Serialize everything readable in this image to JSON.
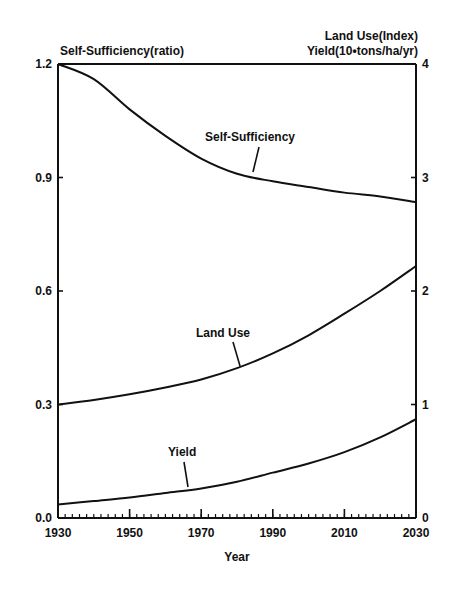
{
  "chart_data": {
    "type": "line",
    "title": "",
    "xlabel": "Year",
    "ylabel_left": "Self-Sufficiency(ratio)",
    "ylabel_right_line1": "Land Use(Index)",
    "ylabel_right_line2": "Yield(10•tons/ha/yr)",
    "xlim": [
      1930,
      2030
    ],
    "ylim_left": [
      0.0,
      1.2
    ],
    "ylim_right": [
      0,
      4
    ],
    "x_ticks": [
      "1930",
      "1950",
      "1970",
      "1990",
      "2010",
      "2030"
    ],
    "y_ticks_left": [
      "0.0",
      "0.3",
      "0.6",
      "0.9",
      "1.2"
    ],
    "y_ticks_right": [
      "0",
      "1",
      "2",
      "3",
      "4"
    ],
    "grid": false,
    "legend": "inline labels",
    "series": [
      {
        "name": "Self-Sufficiency",
        "axis": "left",
        "x": [
          1930,
          1940,
          1950,
          1960,
          1970,
          1980,
          1990,
          2000,
          2010,
          2020,
          2030
        ],
        "values": [
          1.2,
          1.16,
          1.08,
          1.01,
          0.95,
          0.91,
          0.89,
          0.875,
          0.86,
          0.85,
          0.835
        ]
      },
      {
        "name": "Land Use",
        "axis": "right",
        "x": [
          1930,
          1940,
          1950,
          1960,
          1970,
          1980,
          1990,
          2000,
          2010,
          2020,
          2030
        ],
        "values": [
          1.0,
          1.04,
          1.09,
          1.15,
          1.22,
          1.32,
          1.45,
          1.61,
          1.8,
          2.0,
          2.22
        ]
      },
      {
        "name": "Yield",
        "axis": "right",
        "x": [
          1930,
          1940,
          1950,
          1960,
          1970,
          1980,
          1990,
          2000,
          2010,
          2020,
          2030
        ],
        "values": [
          0.12,
          0.15,
          0.18,
          0.22,
          0.26,
          0.32,
          0.4,
          0.48,
          0.58,
          0.71,
          0.87
        ]
      }
    ],
    "annotations": [
      "Self-Sufficiency",
      "Land Use",
      "Yield"
    ]
  },
  "labels": {
    "left_axis_title": "Self-Sufficiency(ratio)",
    "right_axis_title_1": "Land Use(Index)",
    "right_axis_title_2": "Yield(10•tons/ha/yr)",
    "x_axis_title": "Year",
    "series_label_ss": "Self-Sufficiency",
    "series_label_lu": "Land Use",
    "series_label_yield": "Yield"
  }
}
